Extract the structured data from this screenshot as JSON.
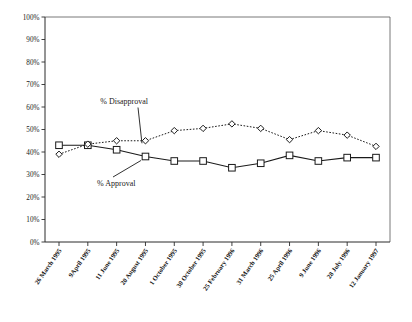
{
  "chart_data": {
    "type": "line",
    "title": "",
    "xlabel": "",
    "ylabel": "",
    "ylim": [
      0,
      100
    ],
    "y_tick_step": 10,
    "grid": false,
    "legend": "none",
    "annotations_position": "inline-with-leader-lines",
    "categories": [
      "26 March 1995",
      "9April 1995",
      "11 June 1995",
      "20 August 1995",
      "1 October 1995",
      "30 October 1995",
      "25 February 1996",
      "31 March 1996",
      "25 April 1996",
      "9 June 1996",
      "28 July 1996",
      "12 January 1997"
    ],
    "y_tick_labels": [
      "100%",
      "90%",
      "80%",
      "70%",
      "60%",
      "50%",
      "40%",
      "30%",
      "20%",
      "10%",
      "0%"
    ],
    "series": [
      {
        "name": "% Approval",
        "marker": "square",
        "line_style": "solid",
        "color": "#1a1a1a",
        "values": [
          43,
          43,
          41,
          38,
          36,
          36,
          33,
          35,
          38.5,
          36,
          37.5,
          37.5
        ]
      },
      {
        "name": "% Disapproval",
        "marker": "diamond",
        "line_style": "dotted",
        "color": "#1a1a1a",
        "values": [
          39,
          43.5,
          45,
          45,
          49.5,
          50.5,
          52.5,
          50.5,
          45.5,
          49.5,
          47.5,
          42.5
        ]
      }
    ],
    "annotations": [
      {
        "text": "% Disapproval",
        "series": "% Disapproval"
      },
      {
        "text": "% Approval",
        "series": "% Approval"
      }
    ]
  }
}
